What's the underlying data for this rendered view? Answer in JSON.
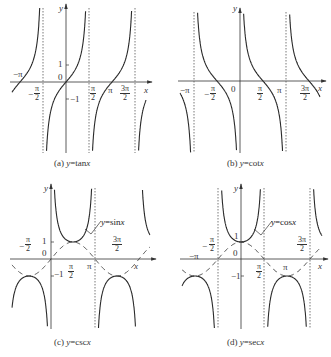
{
  "chart_data": [
    {
      "type": "line",
      "panel": "a",
      "function": "tan",
      "title": "(a) y=tanx",
      "caption_prefix": "(a) ",
      "caption_var": "y",
      "caption_fn": "=tan",
      "caption_x": "x",
      "xlabel": "x",
      "ylabel": "y",
      "origin": [
        66,
        82
      ],
      "half_pi_px": 23,
      "unit_px": 17,
      "y_clip": [
        8,
        153
      ],
      "x_clip": [
        12,
        146
      ],
      "asymptotes": [
        "-π/2",
        "π/2",
        "3π/2"
      ],
      "tick_labels": {
        "x": [
          "-π",
          "-π/2",
          "π/2",
          "π",
          "3π/2"
        ],
        "y": [
          "1",
          "0",
          "-1"
        ]
      }
    },
    {
      "type": "line",
      "panel": "b",
      "function": "cot",
      "title": "(b) y=cotx",
      "xlabel": "x",
      "ylabel": "y",
      "origin": [
        240,
        81
      ],
      "half_pi_px": 23,
      "unit_px": 17,
      "y_clip": [
        12,
        153
      ],
      "x_clip": [
        180,
        320
      ],
      "asymptotes": [
        "-π",
        "0",
        "π"
      ],
      "tick_labels": {
        "x": [
          "-π",
          "-π/2",
          "0",
          "π/2",
          "π",
          "3π/2"
        ]
      }
    },
    {
      "type": "line",
      "panel": "c",
      "function": "csc",
      "title": "(c) y=cscx",
      "xlabel": "x",
      "ylabel": "y",
      "reference_curve": "y=sinx",
      "origin": [
        51,
        259
      ],
      "half_pi_px": 22,
      "unit_px": 17,
      "y_clip": [
        188,
        329
      ],
      "x_clip": [
        12,
        150
      ],
      "asymptotes": [
        "π"
      ],
      "tick_labels": {
        "x": [
          "-π/2",
          "π/2",
          "π",
          "3π/2"
        ],
        "y": [
          "1",
          "0",
          "-1"
        ]
      }
    },
    {
      "type": "line",
      "panel": "d",
      "function": "sec",
      "title": "(d) y=secx",
      "xlabel": "x",
      "ylabel": "y",
      "reference_curve": "y=cosx",
      "origin": [
        241,
        259
      ],
      "half_pi_px": 23,
      "unit_px": 17,
      "y_clip": [
        188,
        329
      ],
      "x_clip": [
        182,
        322
      ],
      "asymptotes": [
        "-π/2",
        "π/2",
        "3π/2"
      ],
      "tick_labels": {
        "x": [
          "-π",
          "-π/2",
          "π/2",
          "π",
          "3π/2"
        ],
        "y": [
          "1",
          "0",
          "-1"
        ]
      }
    }
  ],
  "labels": {
    "a": {
      "y": "y",
      "x": "x",
      "one": "1",
      "zero": "0",
      "neg_one": "−1",
      "neg_pi": "−π",
      "pi": "π",
      "num_pi": "π",
      "num_3pi": "3π",
      "den": "2",
      "neg_sign": "−",
      "caption_pre": "(a) ",
      "caption_y": "y",
      "caption_mid": "=tan",
      "caption_x": "x"
    },
    "b": {
      "y": "y",
      "x": "x",
      "zero": "0",
      "neg_pi": "−π",
      "pi": "π",
      "num_pi": "π",
      "num_3pi": "3π",
      "den": "2",
      "neg_sign": "−",
      "caption_pre": "(b) ",
      "caption_y": "y",
      "caption_mid": "=cot",
      "caption_x": "x"
    },
    "c": {
      "y": "y",
      "x": "x",
      "one": "1",
      "zero": "0",
      "neg_one": "−1",
      "pi": "π",
      "num_pi": "π",
      "num_3pi": "3π",
      "den": "2",
      "neg_sign": "−",
      "ref_y": "y",
      "ref_fn": "=sin",
      "ref_x": "x",
      "caption_pre": "(c) ",
      "caption_y": "y",
      "caption_mid": "=csc",
      "caption_x": "x"
    },
    "d": {
      "y": "y",
      "x": "x",
      "one": "1",
      "zero": "0",
      "neg_one": "−1",
      "neg_pi": "−π",
      "pi": "π",
      "num_pi": "π",
      "num_3pi": "3π",
      "den": "2",
      "neg_sign": "−",
      "ref_y": "y",
      "ref_fn": "=cos",
      "ref_x": "x",
      "caption_pre": "(d) ",
      "caption_y": "y",
      "caption_mid": "=sec",
      "caption_x": "x"
    }
  },
  "colors": {
    "curve": "#2a2a2a",
    "axis": "#333333",
    "dash": "#555555",
    "ref": "#333333"
  }
}
